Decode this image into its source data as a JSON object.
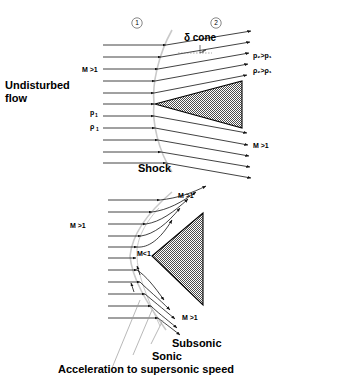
{
  "figure": {
    "background_color": "#ffffff",
    "ink_color": "#000000",
    "shock_color": "#c9c9c9",
    "body_fill": "gray-checkerboard-50"
  },
  "top_diagram": {
    "name": "attached-oblique-shock-on-cone",
    "region_markers": [
      {
        "label": "1",
        "x": 137,
        "y": 23
      },
      {
        "label": "2",
        "x": 216,
        "y": 23
      }
    ],
    "labels": {
      "delta_cone": "δ cone",
      "undisturbed_flow_line1": "Undisturbed",
      "undisturbed_flow_line2": "flow",
      "upstream_mach": "M >1",
      "upstream_pressure": "p",
      "upstream_pressure_sub": "1",
      "upstream_density": "ρ",
      "upstream_density_sub": "1",
      "downstream_pressure": "p₂>p₁",
      "downstream_density": "ρ₂>ρ₁",
      "downstream_mach": "M >1",
      "shock": "Shock"
    }
  },
  "bottom_diagram": {
    "name": "detached-bow-shock-on-blunt-body",
    "labels": {
      "upper_mach": "M >1",
      "left_mach": "M >1",
      "stagnation_mach": "M<1",
      "lower_mach": "M >1",
      "subsonic": "Subsonic",
      "sonic": "Sonic",
      "acceleration": "Acceleration to supersonic speed"
    }
  }
}
